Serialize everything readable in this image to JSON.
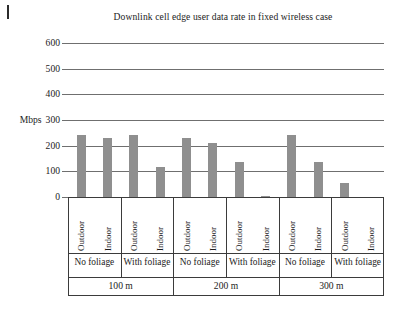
{
  "figure": {
    "title": "Downlink cell edge user data rate in fixed wireless case",
    "unit_label": "Mbps",
    "bar_color": "#8f8f8f",
    "axis_color": "#3b3b3b",
    "grid_color": "#6f6f6f"
  },
  "chart_data": {
    "type": "bar",
    "title": "Downlink cell edge user data rate in fixed wireless case",
    "xlabel": "",
    "ylabel": "Mbps",
    "ylim": [
      0,
      600
    ],
    "yticks": [
      0,
      100,
      200,
      300,
      400,
      500,
      600
    ],
    "ytick_labels": [
      "0",
      "100",
      "200",
      "300",
      "400",
      "500",
      "600"
    ],
    "grid": true,
    "legend": "none",
    "categories": [
      "100 m / No foliage / Outdoor",
      "100 m / No foliage / Indoor",
      "100 m / With foliage / Outdoor",
      "100 m / With foliage / Indoor",
      "200 m / No foliage / Outdoor",
      "200 m / No foliage / Indoor",
      "200 m / With foliage / Outdoor",
      "200 m / With foliage / Indoor",
      "300 m / No foliage / Outdoor",
      "300 m / No foliage / Indoor",
      "300 m / With foliage / Outdoor",
      "300 m / With foliage / Indoor"
    ],
    "values": [
      240,
      230,
      240,
      115,
      230,
      210,
      135,
      5,
      240,
      135,
      55,
      0
    ],
    "group_levels": {
      "distance": [
        "100 m",
        "200 m",
        "300 m"
      ],
      "foliage": [
        "No foliage",
        "With foliage"
      ],
      "placement": [
        "Outdoor",
        "Indoor"
      ]
    }
  },
  "axis": {
    "ticks": [
      {
        "label": "600",
        "unit": ""
      },
      {
        "label": "500",
        "unit": ""
      },
      {
        "label": "400",
        "unit": ""
      },
      {
        "label": "300",
        "unit": "Mbps"
      },
      {
        "label": "200",
        "unit": ""
      },
      {
        "label": "100",
        "unit": ""
      },
      {
        "label": "0",
        "unit": ""
      }
    ]
  },
  "groups": [
    {
      "distance": "100 m",
      "sections": [
        {
          "foliage": "No foliage",
          "bars": [
            {
              "placement": "Outdoor",
              "value": 240
            },
            {
              "placement": "Indoor",
              "value": 230
            }
          ]
        },
        {
          "foliage": "With foliage",
          "bars": [
            {
              "placement": "Outdoor",
              "value": 240
            },
            {
              "placement": "Indoor",
              "value": 115
            }
          ]
        }
      ]
    },
    {
      "distance": "200 m",
      "sections": [
        {
          "foliage": "No foliage",
          "bars": [
            {
              "placement": "Outdoor",
              "value": 230
            },
            {
              "placement": "Indoor",
              "value": 210
            }
          ]
        },
        {
          "foliage": "With foliage",
          "bars": [
            {
              "placement": "Outdoor",
              "value": 135
            },
            {
              "placement": "Indoor",
              "value": 5
            }
          ]
        }
      ]
    },
    {
      "distance": "300 m",
      "sections": [
        {
          "foliage": "No foliage",
          "bars": [
            {
              "placement": "Outdoor",
              "value": 240
            },
            {
              "placement": "Indoor",
              "value": 135
            }
          ]
        },
        {
          "foliage": "With foliage",
          "bars": [
            {
              "placement": "Outdoor",
              "value": 55
            },
            {
              "placement": "Indoor",
              "value": 0
            }
          ]
        }
      ]
    }
  ]
}
